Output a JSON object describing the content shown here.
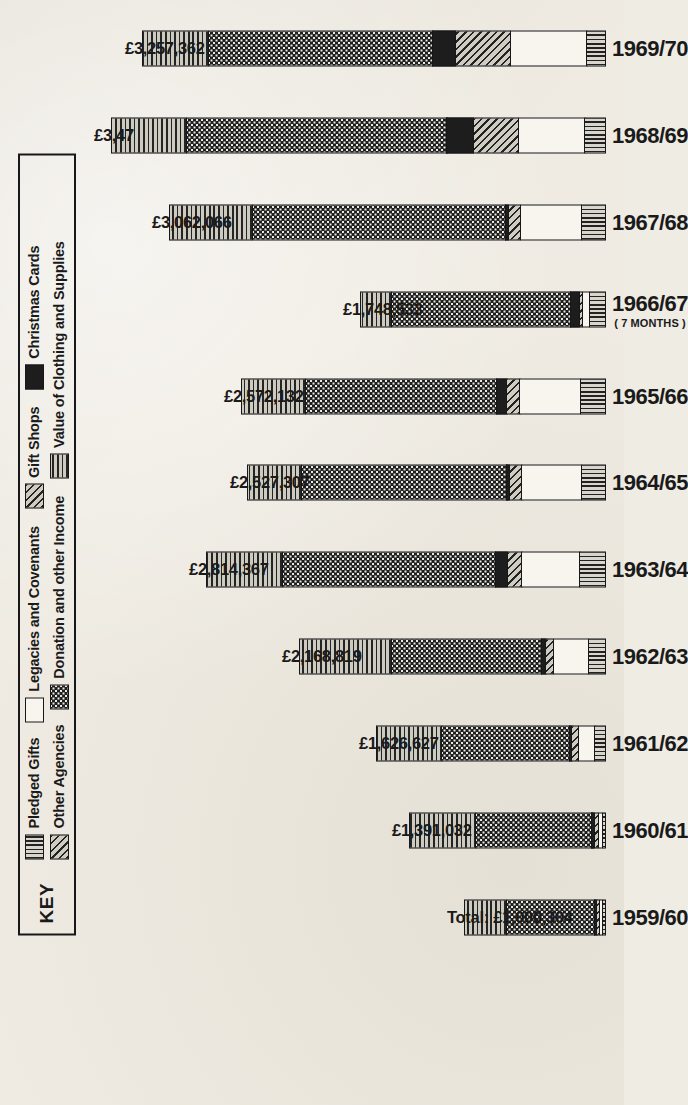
{
  "key": {
    "title": "KEY",
    "entries": [
      {
        "label": "Pledged Gifts",
        "pattern": "vertical-stripes"
      },
      {
        "label": "Legacies and Covenants",
        "pattern": "white"
      },
      {
        "label": "Gift Shops",
        "pattern": "diagonal-hatch"
      },
      {
        "label": "Christmas Cards",
        "pattern": "solid-black"
      },
      {
        "label": "Other Agencies",
        "pattern": "diagonal-hatch-light"
      },
      {
        "label": "Donation and other Income",
        "pattern": "dots"
      },
      {
        "label": "Value of Clothing and Supplies",
        "pattern": "horizontal-stripes"
      }
    ]
  },
  "chart_data": {
    "type": "bar",
    "title": "",
    "xlabel": "",
    "ylabel": "",
    "stacked": true,
    "grid": false,
    "legend_position": "top-left-box",
    "currency": "£",
    "categories": [
      "1959/60",
      "1960/61",
      "1961/62",
      "1962/63",
      "1963/64",
      "1964/65",
      "1965/66",
      "1966/67",
      "1967/68",
      "1968/69",
      "1969/70"
    ],
    "category_notes": {
      "1966/67": "( 7 MONTHS )"
    },
    "total_labels": [
      "Total: £1,000,304",
      "£1,391,032",
      "£1,626,627",
      "£2,168,819",
      "£2,814,367",
      "£2,527,307",
      "£2,572,132",
      "£1,748,533",
      "£3,062,066",
      "£3,47",
      "£3,257,362"
    ],
    "totals": [
      1000304,
      1391032,
      1626627,
      2168819,
      2814367,
      2527307,
      2572132,
      1748533,
      3062066,
      3470000,
      3257362
    ],
    "ylim": [
      0,
      3500000
    ],
    "series": [
      {
        "name": "Pledged Gifts",
        "pattern": "vertical-stripes",
        "values": [
          22000,
          30000,
          80000,
          128000,
          185000,
          175000,
          180000,
          118000,
          175000,
          150000,
          135000
        ]
      },
      {
        "name": "Legacies and Covenants",
        "pattern": "white",
        "values": [
          28000,
          36000,
          125000,
          250000,
          410000,
          420000,
          430000,
          60000,
          430000,
          470000,
          540000
        ]
      },
      {
        "name": "Other Agencies",
        "pattern": "diagonal-hatch-light",
        "values": [
          30000,
          38000,
          55000,
          62000,
          110000,
          95000,
          100000,
          30000,
          95000,
          320000,
          390000
        ]
      },
      {
        "name": "Christmas Cards",
        "pattern": "solid-black",
        "values": [
          5000,
          8000,
          14000,
          38000,
          95000,
          20000,
          82000,
          70000,
          20000,
          195000,
          170000
        ]
      },
      {
        "name": "Donation and other Income",
        "pattern": "dots",
        "values": [
          620000,
          810000,
          890000,
          1050000,
          1480000,
          1430000,
          1330000,
          1250000,
          1760000,
          1810000,
          1560000
        ]
      },
      {
        "name": "Value of Clothing and Supplies",
        "pattern": "horizontal-stripes",
        "values": [
          295000,
          469032,
          462627,
          640819,
          534367,
          387307,
          450132,
          220533,
          582066,
          525000,
          462362
        ]
      }
    ]
  }
}
